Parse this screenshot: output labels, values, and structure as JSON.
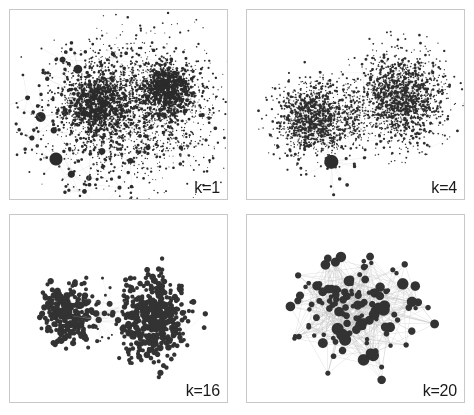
{
  "figure": {
    "background_color": "#ffffff",
    "border_color": "#c8c8c8",
    "node_color": "#2b2b2b",
    "edge_color": "#b4b4b4",
    "label_color": "#1a1a1a",
    "panel_count": 4
  },
  "chart_data": {
    "type": "scatter",
    "xlabel": "",
    "ylabel": "",
    "grid": false,
    "legend": "none",
    "panels": [
      {
        "id": "panel-k1",
        "label": "k=1",
        "k": 1,
        "description": "Full network: two dense hairball communities joined by a narrow bridge, surrounded by a wide halo of scattered peripheral nodes and isolated hub satellites.",
        "node_count": 4200,
        "node_color": "#2b2b2b",
        "edge_color": "#c0c0c0",
        "clusters": [
          {
            "name": "left-core",
            "cx": 0.4,
            "cy": 0.5,
            "rx": 0.19,
            "ry": 0.22,
            "n": 900,
            "size_min": 0.7,
            "size_max": 1.9
          },
          {
            "name": "right-core",
            "cx": 0.72,
            "cy": 0.42,
            "rx": 0.15,
            "ry": 0.18,
            "n": 800,
            "size_min": 0.7,
            "size_max": 1.9
          },
          {
            "name": "halo",
            "cx": 0.55,
            "cy": 0.52,
            "rx": 0.46,
            "ry": 0.44,
            "n": 1700,
            "size_min": 0.5,
            "size_max": 1.4
          }
        ],
        "hubs": [
          {
            "cx": 0.14,
            "cy": 0.56,
            "r": 5.0
          },
          {
            "cx": 0.21,
            "cy": 0.78,
            "r": 6.5
          },
          {
            "cx": 0.28,
            "cy": 0.86,
            "r": 3.6
          },
          {
            "cx": 0.36,
            "cy": 0.88,
            "r": 2.8
          },
          {
            "cx": 0.1,
            "cy": 0.67,
            "r": 2.6
          },
          {
            "cx": 0.2,
            "cy": 0.63,
            "r": 3.2
          },
          {
            "cx": 0.31,
            "cy": 0.31,
            "r": 4.4
          },
          {
            "cx": 0.24,
            "cy": 0.26,
            "r": 3.0
          },
          {
            "cx": 0.42,
            "cy": 0.74,
            "r": 3.4
          },
          {
            "cx": 0.55,
            "cy": 0.79,
            "r": 3.0
          },
          {
            "cx": 0.63,
            "cy": 0.72,
            "r": 2.6
          },
          {
            "cx": 0.08,
            "cy": 0.46,
            "r": 2.4
          },
          {
            "cx": 0.47,
            "cy": 0.23,
            "r": 2.2
          },
          {
            "cx": 0.17,
            "cy": 0.36,
            "r": 2.2
          },
          {
            "cx": 0.34,
            "cy": 0.95,
            "r": 2.4
          },
          {
            "cx": 0.5,
            "cy": 0.93,
            "r": 2.0
          },
          {
            "cx": 0.78,
            "cy": 0.72,
            "r": 2.2
          },
          {
            "cx": 0.88,
            "cy": 0.55,
            "r": 2.0
          }
        ]
      },
      {
        "id": "panel-k4",
        "label": "k=4",
        "k": 4,
        "description": "Two roughly circular dense blobs of fine-grained nodes; left blob smaller and lower, right blob larger and higher, a sparse speckled bridge between them and one solid dark hub below the left blob.",
        "node_count": 3000,
        "node_color": "#2e2e2e",
        "edge_color": "#c4c4c4",
        "clusters": [
          {
            "name": "left-blob",
            "cx": 0.3,
            "cy": 0.57,
            "rx": 0.2,
            "ry": 0.24,
            "n": 1150,
            "size_min": 0.6,
            "size_max": 1.5
          },
          {
            "name": "right-blob",
            "cx": 0.7,
            "cy": 0.46,
            "rx": 0.24,
            "ry": 0.28,
            "n": 1500,
            "size_min": 0.6,
            "size_max": 1.5
          },
          {
            "name": "bridge",
            "cx": 0.49,
            "cy": 0.55,
            "rx": 0.08,
            "ry": 0.22,
            "n": 180,
            "size_min": 0.5,
            "size_max": 1.1
          }
        ],
        "hubs": [
          {
            "cx": 0.385,
            "cy": 0.795,
            "r": 7.0
          }
        ]
      },
      {
        "id": "panel-k16",
        "label": "k=16",
        "k": 16,
        "description": "Two well-separated discs of clearly resolved round nodes connected by a thin faint bundle of bridge edges; left disc smaller, right disc larger and positioned slightly lower-right.",
        "node_count": 760,
        "node_color": "#333333",
        "edge_color": "#cfcfcf",
        "clusters": [
          {
            "name": "left-disc",
            "cx": 0.265,
            "cy": 0.525,
            "rx": 0.135,
            "ry": 0.185,
            "n": 260,
            "size_min": 1.9,
            "size_max": 3.4
          },
          {
            "name": "right-disc",
            "cx": 0.655,
            "cy": 0.545,
            "rx": 0.195,
            "ry": 0.255,
            "n": 470,
            "size_min": 1.9,
            "size_max": 3.4
          }
        ],
        "hubs": [
          {
            "cx": 0.405,
            "cy": 0.555,
            "r": 3.2
          },
          {
            "cx": 0.455,
            "cy": 0.47,
            "r": 3.0
          }
        ],
        "bridge": {
          "from_x": 0.385,
          "from_y": 0.545,
          "to_x": 0.5,
          "to_y": 0.52,
          "strands": 18
        }
      },
      {
        "id": "panel-k20",
        "label": "k=20",
        "k": 20,
        "description": "Single densely interconnected community; ~130 distinctly visible circular nodes of varied radius linked by a web of thin gray edges, largest hubs near the centre and upper region.",
        "node_count": 132,
        "node_color": "#333333",
        "edge_color": "#bdbdbd",
        "clusters": [
          {
            "name": "core",
            "cx": 0.5,
            "cy": 0.5,
            "rx": 0.34,
            "ry": 0.38,
            "n": 132,
            "size_min": 2.2,
            "size_max": 6.2
          }
        ],
        "hubs": [],
        "edge_density": 0.055
      }
    ]
  },
  "panels": [
    {
      "name": "panel-k1",
      "label": "k=1"
    },
    {
      "name": "panel-k4",
      "label": "k=4"
    },
    {
      "name": "panel-k16",
      "label": "k=16"
    },
    {
      "name": "panel-k20",
      "label": "k=20"
    }
  ]
}
